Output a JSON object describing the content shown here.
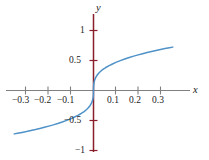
{
  "chart_data": {
    "type": "line",
    "title": "",
    "subtitle": "",
    "xlabel": "x",
    "ylabel": "y",
    "xlim": [
      -0.375,
      0.375
    ],
    "ylim": [
      -1.22,
      1.22
    ],
    "grid": false,
    "legend": null,
    "x_ticks": [
      -0.3,
      -0.2,
      -0.1,
      0.1,
      0.2,
      0.3
    ],
    "x_tick_labels": [
      "−0.3",
      "−0.2",
      "−0.1",
      "0.1",
      "0.2",
      "0.3"
    ],
    "y_ticks": [
      1,
      0.5,
      -0.5,
      -1
    ],
    "y_tick_labels": [
      "1",
      "0.5",
      "−0.5",
      "−1"
    ],
    "series": [
      {
        "name": "y = x^(1/3)",
        "color": "#4f92c8",
        "x": [
          -0.355,
          -0.34,
          -0.32,
          -0.3,
          -0.28,
          -0.26,
          -0.24,
          -0.22,
          -0.2,
          -0.18,
          -0.16,
          -0.14,
          -0.12,
          -0.1,
          -0.085,
          -0.07,
          -0.055,
          -0.042,
          -0.031,
          -0.022,
          -0.015,
          -0.009,
          -0.005,
          -0.002,
          -0.0005,
          0,
          0.0005,
          0.002,
          0.005,
          0.009,
          0.015,
          0.022,
          0.031,
          0.042,
          0.055,
          0.07,
          0.085,
          0.1,
          0.12,
          0.14,
          0.16,
          0.18,
          0.2,
          0.22,
          0.24,
          0.26,
          0.28,
          0.3,
          0.32,
          0.34,
          0.355
        ],
        "y": [
          -0.723,
          -0.713,
          -0.699,
          -0.684,
          -0.667,
          -0.651,
          -0.633,
          -0.614,
          -0.594,
          -0.573,
          -0.55,
          -0.525,
          -0.498,
          -0.468,
          -0.442,
          -0.415,
          -0.383,
          -0.351,
          -0.317,
          -0.283,
          -0.249,
          -0.21,
          -0.173,
          -0.127,
          -0.08,
          0,
          0.08,
          0.127,
          0.173,
          0.21,
          0.249,
          0.283,
          0.317,
          0.351,
          0.383,
          0.415,
          0.442,
          0.468,
          0.498,
          0.525,
          0.55,
          0.573,
          0.594,
          0.614,
          0.633,
          0.651,
          0.667,
          0.684,
          0.699,
          0.713,
          0.723
        ]
      }
    ],
    "axis_colors": {
      "x_axis": "#808080",
      "y_axis": "#8a1f2b",
      "curve": "#4f92c8"
    }
  }
}
